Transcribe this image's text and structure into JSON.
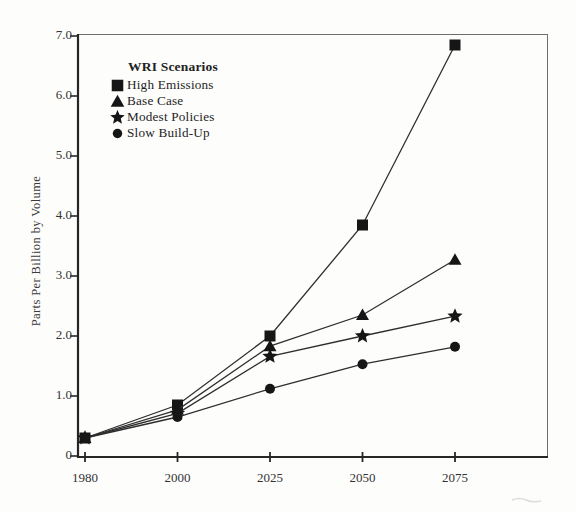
{
  "figure": {
    "background": "#fdfdfc",
    "ink": "#161616",
    "line_color": "#2e2e2e",
    "axis_color": "#262626",
    "frame_color": "#6e6e6e",
    "text_color": "#333333"
  },
  "chart_data": {
    "type": "line",
    "title": "",
    "xlabel": "",
    "ylabel": "Parts Per Billion by Volume",
    "categories": [
      "1980",
      "2000",
      "2025",
      "2050",
      "2075"
    ],
    "y_ticks": [
      "7.0",
      "6.0",
      "5.0",
      "4.0",
      "3.0",
      "2.0",
      "1.0",
      "0"
    ],
    "y_tick_values": [
      7,
      6,
      5,
      4,
      3,
      2,
      1,
      0
    ],
    "ylim": [
      0,
      7
    ],
    "grid": false,
    "legend_title": "WRI Scenarios",
    "legend_position": "upper-left-inside",
    "series": [
      {
        "name": "High Emissions",
        "marker": "square",
        "values": [
          0.3,
          0.85,
          2.0,
          3.85,
          6.85
        ]
      },
      {
        "name": "Base Case",
        "marker": "triangle",
        "values": [
          0.3,
          0.77,
          1.83,
          2.35,
          3.27
        ]
      },
      {
        "name": "Modest Policies",
        "marker": "star",
        "values": [
          0.3,
          0.71,
          1.66,
          2.0,
          2.33
        ]
      },
      {
        "name": "Slow Build-Up",
        "marker": "circle",
        "values": [
          0.3,
          0.65,
          1.12,
          1.53,
          1.82
        ]
      }
    ]
  }
}
